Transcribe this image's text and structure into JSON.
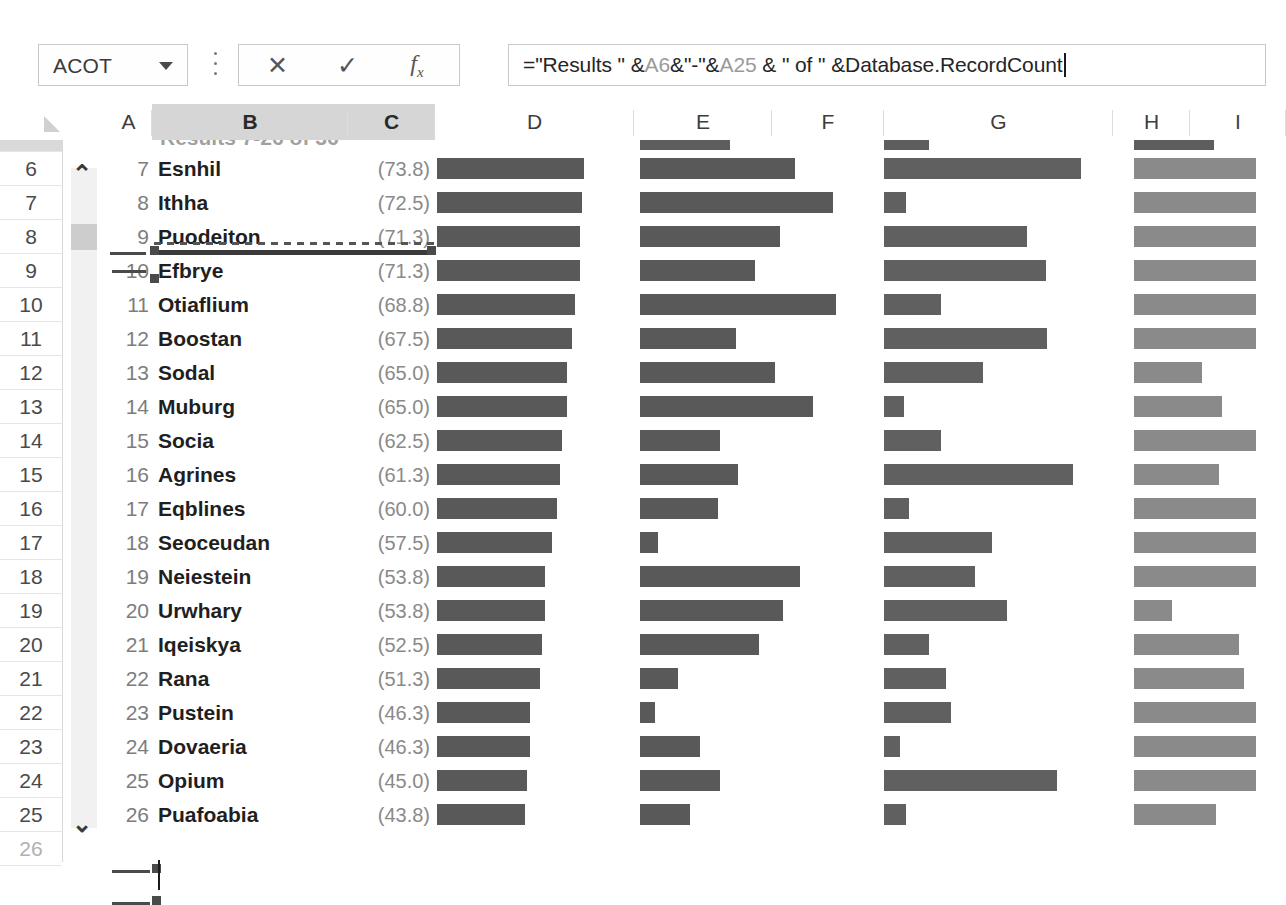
{
  "app": "Microsoft Excel",
  "formula_bar": {
    "name_box_value": "ACOT",
    "name_box_dropdown_icon": "chevron-down-icon",
    "more_icon": "vertical-ellipsis-icon",
    "cancel_label": "✕",
    "enter_label": "✓",
    "insert_function_label": "fx",
    "formula_full": "=\"Results \" &A6&\"-\"&A25 & \" of \" &Database.RecordCount",
    "formula_parts": {
      "p1": "=\"Results \" &",
      "ref1": "A6",
      "p2": "&\"-\"&",
      "ref2": "A25",
      "p3": " & \" of \" &Database.RecordCount"
    }
  },
  "grid": {
    "select_all_icon": "select-all-triangle-icon",
    "column_headers": [
      {
        "label": "A",
        "selected": false
      },
      {
        "label": "B",
        "selected": true
      },
      {
        "label": "C",
        "selected": true
      },
      {
        "label": "D",
        "selected": false
      },
      {
        "label": "E",
        "selected": false
      },
      {
        "label": "F",
        "selected": false
      },
      {
        "label": "G",
        "selected": false
      },
      {
        "label": "H",
        "selected": false
      },
      {
        "label": "I",
        "selected": false
      }
    ],
    "row_headers": [
      "5",
      "6",
      "7",
      "8",
      "9",
      "10",
      "11",
      "12",
      "13",
      "14",
      "15",
      "16",
      "17",
      "18",
      "19",
      "20",
      "21",
      "22",
      "23",
      "24",
      "25",
      "26"
    ],
    "scroll_up_icon": "chevron-up-icon",
    "scroll_down_icon": "chevron-down-icon",
    "clipped_header_text": "Results 7-26 of 36"
  },
  "chart_data": {
    "type": "bar",
    "title": "Results 7-26 of 36",
    "xlabel": "",
    "ylabel": "",
    "categories": [
      "Esnhil",
      "Ithha",
      "Puodeiton",
      "Efbrye",
      "Otiaflium",
      "Boostan",
      "Sodal",
      "Muburg",
      "Socia",
      "Agrines",
      "Eqblines",
      "Seoceudan",
      "Neiestein",
      "Urwhary",
      "Iqeiskya",
      "Rana",
      "Pustein",
      "Dovaeria",
      "Opium",
      "Puafoabia"
    ],
    "rank_numbers": [
      7,
      8,
      9,
      10,
      11,
      12,
      13,
      14,
      15,
      16,
      17,
      18,
      19,
      20,
      21,
      22,
      23,
      24,
      25,
      26
    ],
    "series": [
      {
        "name": "C",
        "display_values": [
          "(73.8)",
          "(72.5)",
          "(71.3)",
          "(71.3)",
          "(68.8)",
          "(67.5)",
          "(65.0)",
          "(65.0)",
          "(62.5)",
          "(61.3)",
          "(60.0)",
          "(57.5)",
          "(53.8)",
          "(53.8)",
          "(52.5)",
          "(51.3)",
          "(46.3)",
          "(46.3)",
          "(45.0)",
          "(43.8)"
        ],
        "values": [
          73.8,
          72.5,
          71.3,
          71.3,
          68.8,
          67.5,
          65.0,
          65.0,
          62.5,
          61.3,
          60.0,
          57.5,
          53.8,
          53.8,
          52.5,
          51.3,
          46.3,
          46.3,
          45.0,
          43.8
        ]
      },
      {
        "name": "D",
        "bar_widths": [
          147,
          145,
          143,
          143,
          138,
          135,
          130,
          130,
          125,
          123,
          120,
          115,
          108,
          108,
          105,
          103,
          93,
          93,
          90,
          88
        ]
      },
      {
        "name": "E",
        "bar_widths": [
          155,
          193,
          140,
          115,
          196,
          96,
          135,
          173,
          80,
          98,
          78,
          18,
          160,
          143,
          119,
          38,
          15,
          60,
          80,
          50
        ]
      },
      {
        "name": "G",
        "bar_widths": [
          197,
          22,
          143,
          162,
          57,
          163,
          99,
          20,
          57,
          189,
          25,
          108,
          91,
          123,
          45,
          62,
          67,
          16,
          173,
          22
        ]
      },
      {
        "name": "I",
        "bar_widths": [
          122,
          122,
          122,
          122,
          122,
          122,
          68,
          88,
          122,
          85,
          122,
          122,
          122,
          38,
          105,
          110,
          122,
          122,
          122,
          82
        ]
      }
    ],
    "grid": false,
    "legend": "none"
  }
}
